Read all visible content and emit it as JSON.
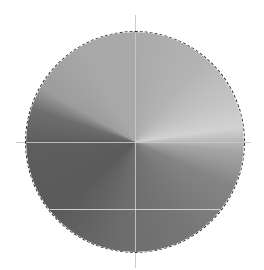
{
  "canvas": {
    "background": "#ffffff",
    "selection": {
      "shape": "ellipse",
      "style": "marching-ants",
      "color": "#2a2a2a"
    },
    "fill": {
      "type": "conical-gradient",
      "center": [
        135,
        142
      ],
      "stops": [
        {
          "angle_deg": 0,
          "color": "#a9a9a9"
        },
        {
          "angle_deg": 40,
          "color": "#b4b4b4"
        },
        {
          "angle_deg": 65,
          "color": "#c4c4c4"
        },
        {
          "angle_deg": 82,
          "color": "#d2d2d2"
        },
        {
          "angle_deg": 95,
          "color": "#a6a6a6"
        },
        {
          "angle_deg": 115,
          "color": "#848484"
        },
        {
          "angle_deg": 150,
          "color": "#767676"
        },
        {
          "angle_deg": 190,
          "color": "#6c6c6c"
        },
        {
          "angle_deg": 230,
          "color": "#5a5a5a"
        },
        {
          "angle_deg": 270,
          "color": "#5e5e5e"
        },
        {
          "angle_deg": 288,
          "color": "#6e6e6e"
        },
        {
          "angle_deg": 300,
          "color": "#9c9c9c"
        },
        {
          "angle_deg": 330,
          "color": "#a8a8a8"
        },
        {
          "angle_deg": 360,
          "color": "#a9a9a9"
        }
      ]
    },
    "guides": {
      "vertical": [
        {
          "x": 135,
          "y1": 15,
          "y2": 268
        }
      ],
      "horizontal": [
        {
          "y": 142,
          "x1": 16,
          "x2": 251
        },
        {
          "y": 209,
          "x1": 50,
          "x2": 220
        }
      ]
    }
  }
}
